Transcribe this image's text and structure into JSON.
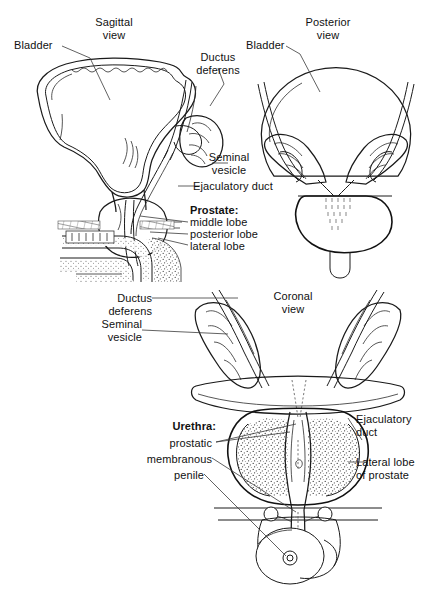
{
  "figure": {
    "background_color": "#ffffff",
    "line_color": "#1a1a1a",
    "text_color": "#111111"
  },
  "panels": {
    "sagittal": {
      "view_label_line1": "Sagittal",
      "view_label_line2": "view",
      "labels": {
        "bladder": "Bladder",
        "ductus_deferens_line1": "Ductus",
        "ductus_deferens_line2": "deferens",
        "seminal_vesicle_line1": "Seminal",
        "seminal_vesicle_line2": "vesicle",
        "ejaculatory_duct": "Ejaculatory duct",
        "prostate_heading": "Prostate:",
        "prostate_lobe_1": "middle lobe",
        "prostate_lobe_2": "posterior lobe",
        "prostate_lobe_3": "lateral lobe"
      }
    },
    "posterior": {
      "view_label_line1": "Posterior",
      "view_label_line2": "view",
      "labels": {
        "bladder": "Bladder"
      }
    },
    "coronal": {
      "view_label_line1": "Coronal",
      "view_label_line2": "view",
      "labels": {
        "ductus_deferens_line1": "Ductus",
        "ductus_deferens_line2": "deferens",
        "seminal_vesicle_line1": "Seminal",
        "seminal_vesicle_line2": "vesicle",
        "urethra_heading": "Urethra:",
        "urethra_part_1": "prostatic",
        "urethra_part_2": "membranous",
        "urethra_part_3": "penile",
        "ejaculatory_duct_line1": "Ejaculatory",
        "ejaculatory_duct_line2": "duct",
        "lateral_lobe_line1": "Lateral lobe",
        "lateral_lobe_line2": "of prostate"
      }
    }
  }
}
